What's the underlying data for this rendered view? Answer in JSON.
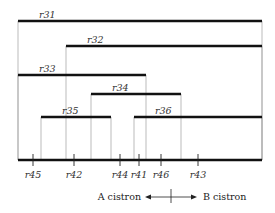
{
  "deletions": [
    {
      "label": "r31",
      "x1": 18,
      "x2": 262,
      "y": 21
    },
    {
      "label": "r32",
      "x1": 66,
      "x2": 262,
      "y": 46
    },
    {
      "label": "r33",
      "x1": 18,
      "x2": 146,
      "y": 75
    },
    {
      "label": "r34",
      "x1": 91,
      "x2": 181,
      "y": 94
    },
    {
      "label": "r35",
      "x1": 41,
      "x2": 111,
      "y": 117
    },
    {
      "label": "r36",
      "x1": 134,
      "x2": 262,
      "y": 117
    }
  ],
  "baseline": {
    "x1": 18,
    "x2": 262,
    "y": 160
  },
  "markers": [
    {
      "label": "r45",
      "x": 33
    },
    {
      "label": "r42",
      "x": 74
    },
    {
      "label": "r44",
      "x": 120
    },
    {
      "label": "r41",
      "x": 139
    },
    {
      "label": "r46",
      "x": 161
    },
    {
      "label": "r43",
      "x": 198
    }
  ],
  "caption": {
    "left": "A cistron",
    "right": "B cistron",
    "divider_x": 171
  }
}
